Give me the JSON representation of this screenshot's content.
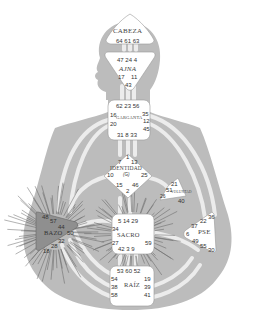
{
  "diagram": {
    "type": "human-design-bodygraph",
    "colors": {
      "body": "#b9b9b9",
      "channel": "#ececec",
      "center_fill": "#ffffff",
      "spleen_defined": "#8f8f8f",
      "rays": "#555555"
    },
    "centers": {
      "head": {
        "name": "CABEZA",
        "gates_row1": "64 61 63"
      },
      "ajna": {
        "name": "AJNA",
        "gates_top": "47 24 4",
        "gate_l": "17",
        "gate_r": "11",
        "gate_b": "43"
      },
      "throat": {
        "name": "GARGANTA",
        "gates_top": "62 23 56",
        "g16": "16",
        "g20": "20",
        "g35": "35",
        "g12": "12",
        "g45": "45",
        "gates_bottom": "31  8  33"
      },
      "identity": {
        "name": "IDENTIDAD",
        "sub": "(G)",
        "g1": "1",
        "g7": "7",
        "g13": "13",
        "g10": "10",
        "g25": "25",
        "g15": "15",
        "g46": "46",
        "g2": "2"
      },
      "will": {
        "name": "VOLUNTAD",
        "g21": "21",
        "g51": "51",
        "g26": "26",
        "g40": "40"
      },
      "spleen": {
        "name": "BAZO",
        "g48": "48",
        "g57": "57",
        "g44": "44",
        "g50": "50",
        "g32": "32",
        "g28": "28",
        "g18": "18"
      },
      "sacral": {
        "name": "SACRO",
        "gates_top": "5 14 29",
        "g34": "34",
        "g27": "27",
        "g59": "59",
        "gates_bottom": "42  3  9"
      },
      "solar_plexus": {
        "name": "PSE",
        "g36": "36",
        "g22": "22",
        "g37": "37",
        "g6": "6",
        "g49": "49",
        "g55": "55",
        "g30": "30"
      },
      "root": {
        "name": "RAÍZ",
        "gates_top": "53 60 52",
        "g54": "54",
        "g38": "38",
        "g58": "58",
        "g19": "19",
        "g39": "39",
        "g41": "41"
      }
    }
  }
}
